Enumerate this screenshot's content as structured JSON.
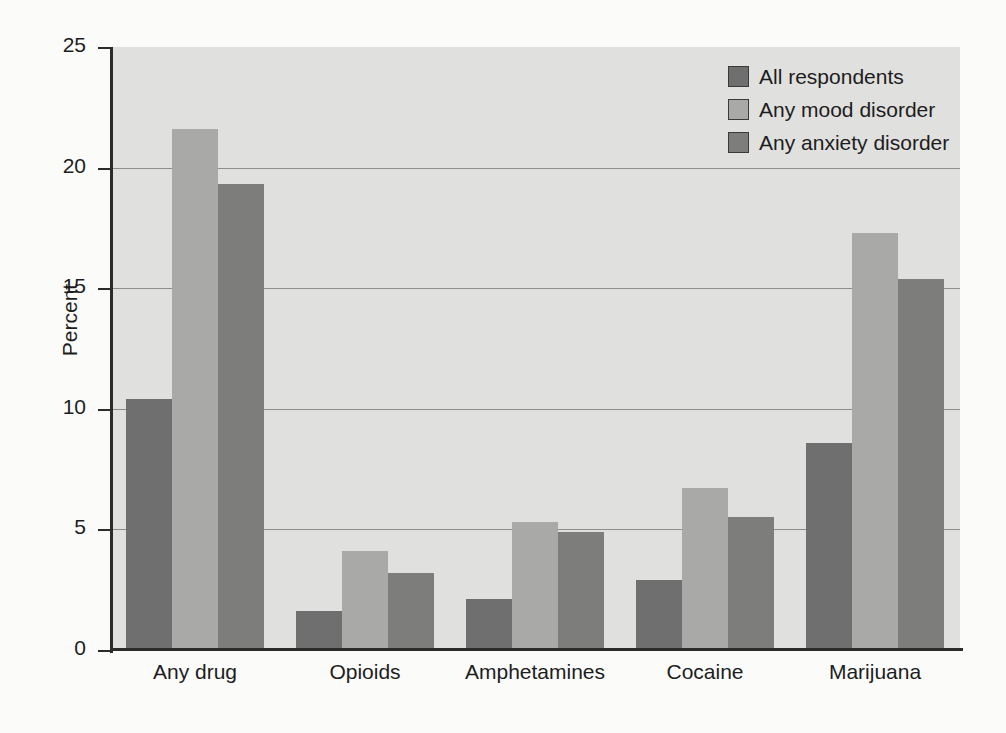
{
  "chart_data": {
    "type": "bar",
    "title": "",
    "xlabel": "",
    "ylabel": "Percent",
    "ylim": [
      0,
      25
    ],
    "yticks": [
      0,
      5,
      10,
      15,
      20,
      25
    ],
    "grid": true,
    "legend_position": "top-right",
    "categories": [
      "Any drug",
      "Opioids",
      "Amphetamines",
      "Cocaine",
      "Marijuana"
    ],
    "series": [
      {
        "name": "All respondents",
        "color": "#6f6f6f",
        "values": [
          10.4,
          1.6,
          2.1,
          2.9,
          8.6
        ]
      },
      {
        "name": "Any mood disorder",
        "color": "#a9a9a7",
        "values": [
          21.6,
          4.1,
          5.3,
          6.7,
          17.3
        ]
      },
      {
        "name": "Any anxiety disorder",
        "color": "#7d7d7b",
        "values": [
          19.3,
          3.2,
          4.9,
          5.5,
          15.4
        ]
      }
    ]
  },
  "legend": {
    "items": [
      {
        "label": "All respondents"
      },
      {
        "label": "Any mood disorder"
      },
      {
        "label": "Any anxiety disorder"
      }
    ]
  },
  "page_bleed": {
    "top": "",
    "bottom": ""
  }
}
